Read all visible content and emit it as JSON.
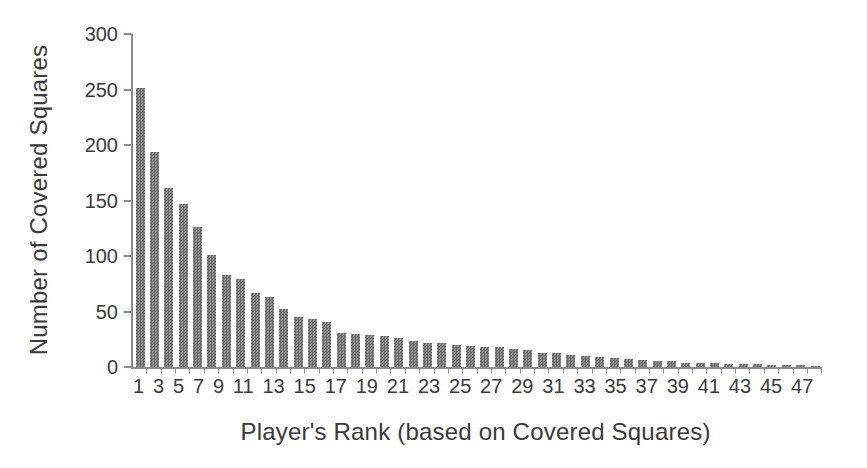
{
  "figure": {
    "background": "#ffffff",
    "bar_color": "#7d7d7d",
    "bar_pattern_dark": "#6b6b6b",
    "bar_pattern_light": "#939393",
    "axis_color": "#8c8c8c",
    "text_color": "#3a3a3a"
  },
  "chart_data": {
    "type": "bar",
    "title": "",
    "xlabel": "Player's Rank (based on Covered Squares)",
    "ylabel": "Number of Covered Squares",
    "categories": [
      1,
      2,
      3,
      4,
      5,
      6,
      7,
      8,
      9,
      10,
      11,
      12,
      13,
      14,
      15,
      16,
      17,
      18,
      19,
      20,
      21,
      22,
      23,
      24,
      25,
      26,
      27,
      28,
      29,
      30,
      31,
      32,
      33,
      34,
      35,
      36,
      37,
      38,
      39,
      40,
      41,
      42,
      43,
      44,
      45,
      46,
      47,
      48
    ],
    "values": [
      251,
      194,
      161,
      147,
      126,
      101,
      83,
      79,
      67,
      63,
      52,
      45,
      43,
      41,
      31,
      30,
      29,
      28,
      26,
      23,
      22,
      22,
      20,
      19,
      18,
      18,
      16,
      15,
      13,
      13,
      11,
      10,
      9,
      8,
      7,
      6,
      5,
      5,
      4,
      4,
      4,
      3,
      3,
      3,
      2,
      2,
      2,
      1
    ],
    "ylim": [
      0,
      300
    ],
    "y_ticks": [
      0,
      50,
      100,
      150,
      200,
      250,
      300
    ],
    "x_tick_labels": [
      "1",
      "3",
      "5",
      "7",
      "9",
      "11",
      "13",
      "15",
      "17",
      "19",
      "21",
      "23",
      "25",
      "27",
      "29",
      "31",
      "33",
      "35",
      "37",
      "39",
      "41",
      "43",
      "45",
      "47"
    ],
    "x_label_step": 2,
    "grid": "off",
    "legend": "none",
    "bar_fill": "gray checkered pattern"
  }
}
